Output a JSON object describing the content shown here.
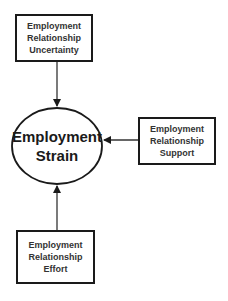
{
  "diagram": {
    "type": "flow",
    "central_node": {
      "label_lines": [
        "Employment",
        "Strain"
      ],
      "shape": "ellipse"
    },
    "nodes": [
      {
        "id": "uncertainty",
        "label_lines": [
          "Employment",
          "Relationship",
          "Uncertainty"
        ],
        "position": "top"
      },
      {
        "id": "support",
        "label_lines": [
          "Employment",
          "Relationship",
          "Support"
        ],
        "position": "right"
      },
      {
        "id": "effort",
        "label_lines": [
          "Employment",
          "Relationship",
          "Effort"
        ],
        "position": "bottom"
      }
    ],
    "edges": [
      {
        "from": "uncertainty",
        "to": "central"
      },
      {
        "from": "support",
        "to": "central"
      },
      {
        "from": "effort",
        "to": "central"
      }
    ],
    "colors": {
      "stroke": "#1a1a1a",
      "text": "#333333",
      "background": "#ffffff"
    }
  }
}
